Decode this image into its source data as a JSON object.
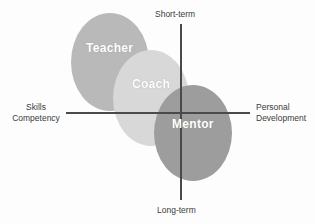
{
  "diagram": {
    "axes": {
      "vertical": {
        "top_label": "Short-term",
        "bottom_label": "Long-term"
      },
      "horizontal": {
        "left_label_line1": "Skills",
        "left_label_line2": "Competency",
        "right_label_line1": "Personal",
        "right_label_line2": "Development"
      }
    },
    "roles": [
      {
        "label": "Teacher",
        "color": "#b9b9b9"
      },
      {
        "label": "Coach",
        "color": "#d8d8d8"
      },
      {
        "label": "Mentor",
        "color": "#9d9d9d"
      }
    ],
    "colors": {
      "axis_line": "#4a4a4a",
      "caption_text": "#3b3b3b",
      "role_text": "#ffffff",
      "background": "#fdfdfd"
    }
  }
}
